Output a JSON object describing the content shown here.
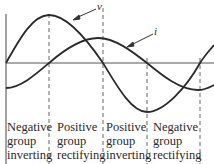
{
  "diagram": {
    "waves": [
      {
        "name": "voltage",
        "label": "v"
      },
      {
        "name": "current",
        "label": "i"
      }
    ],
    "regions": [
      {
        "line1": "Negative",
        "line2": "group",
        "line3": "inverting"
      },
      {
        "line1": "Positive",
        "line2": "group",
        "line3": "rectifying"
      },
      {
        "line1": "Positive",
        "line2": "group",
        "line3": "inverting"
      },
      {
        "line1": "Negative",
        "line2": "group",
        "line3": "rectifying"
      }
    ]
  }
}
